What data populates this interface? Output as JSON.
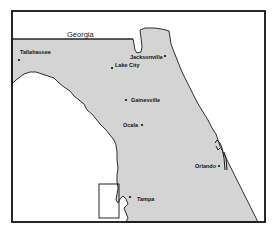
{
  "map": {
    "type": "regional-locator-map",
    "region": "Florida",
    "colors": {
      "land": "#d4d4d4",
      "water": "#ffffff",
      "outline": "#1a1a1a",
      "frame": "#111111"
    },
    "labels": {
      "neighbor": "Georgia"
    },
    "cities": [
      {
        "name": "Tallahassee",
        "x": 18,
        "y": 58
      },
      {
        "name": "Jacksonville",
        "x": 165,
        "y": 53
      },
      {
        "name": "Lake City",
        "x": 112,
        "y": 68
      },
      {
        "name": "Gainesville",
        "x": 126,
        "y": 100
      },
      {
        "name": "Ocala",
        "x": 142,
        "y": 125
      },
      {
        "name": "Orlando",
        "x": 194,
        "y": 165
      },
      {
        "name": "Tampa",
        "x": 130,
        "y": 197
      }
    ],
    "highlight_box": {
      "label": "study-area",
      "x": 99,
      "y": 184,
      "width": 20,
      "height": 34
    }
  }
}
